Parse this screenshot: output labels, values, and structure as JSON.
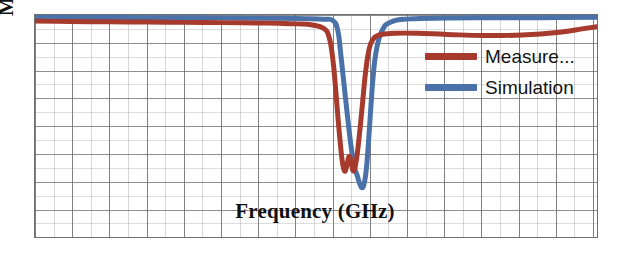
{
  "chart_data": {
    "type": "line",
    "title": "",
    "subtitle": "",
    "xlabel": "Frequency (GHz)",
    "ylabel": "Magnitude (dB)",
    "xlim": [
      0,
      15
    ],
    "ylim": [
      -8,
      0
    ],
    "grid": true,
    "grid_major_x_divisions": 15,
    "grid_major_y_divisions": 8,
    "grid_minor_subdivisions": 2,
    "axis_tick_labels_visible": false,
    "xticklabels": [],
    "yticklabels": [],
    "legend_position": "upper right",
    "annotations": [],
    "series": [
      {
        "name": "Measure...",
        "full_name": "Measure...",
        "color": "#A63A2D",
        "linewidth": 5,
        "x": [
          0.0,
          0.6,
          1.5,
          2.5,
          3.5,
          4.5,
          5.5,
          6.5,
          7.0,
          7.4,
          7.7,
          7.85,
          7.95,
          8.02,
          8.08,
          8.14,
          8.2,
          8.26,
          8.32,
          8.38,
          8.44,
          8.5,
          8.58,
          8.66,
          8.74,
          8.82,
          8.9,
          9.0,
          9.2,
          9.6,
          10.2,
          11.0,
          12.0,
          13.0,
          14.0,
          14.6,
          15.0
        ],
        "y": [
          -0.22,
          -0.23,
          -0.24,
          -0.25,
          -0.26,
          -0.27,
          -0.28,
          -0.3,
          -0.32,
          -0.36,
          -0.48,
          -0.8,
          -1.6,
          -2.6,
          -3.6,
          -4.5,
          -5.25,
          -5.62,
          -5.45,
          -5.1,
          -5.3,
          -5.62,
          -5.2,
          -4.3,
          -3.2,
          -2.1,
          -1.35,
          -0.92,
          -0.72,
          -0.66,
          -0.66,
          -0.7,
          -0.74,
          -0.72,
          -0.62,
          -0.5,
          -0.42
        ]
      },
      {
        "name": "Simulation",
        "full_name": "Simulation",
        "color": "#4A72A8",
        "linewidth": 5,
        "x": [
          0.0,
          0.6,
          1.5,
          2.5,
          3.5,
          4.5,
          5.5,
          6.5,
          7.2,
          7.7,
          7.95,
          8.08,
          8.16,
          8.24,
          8.32,
          8.4,
          8.48,
          8.54,
          8.6,
          8.66,
          8.72,
          8.78,
          8.84,
          8.9,
          8.96,
          9.02,
          9.1,
          9.25,
          9.5,
          10.0,
          11.0,
          12.0,
          13.0,
          14.0,
          15.0
        ],
        "y": [
          -0.08,
          -0.08,
          -0.09,
          -0.09,
          -0.1,
          -0.1,
          -0.11,
          -0.12,
          -0.13,
          -0.15,
          -0.2,
          -0.55,
          -1.4,
          -2.4,
          -3.4,
          -4.35,
          -5.15,
          -5.55,
          -5.78,
          -6.05,
          -6.22,
          -6.1,
          -5.6,
          -4.6,
          -3.4,
          -2.3,
          -1.35,
          -0.6,
          -0.25,
          -0.14,
          -0.11,
          -0.1,
          -0.1,
          -0.09,
          -0.08
        ]
      }
    ],
    "legend": [
      {
        "label": "Measure...",
        "color": "#A63A2D"
      },
      {
        "label": "Simulation",
        "color": "#4A72A8"
      }
    ],
    "colors": {
      "measured": "#A63A2D",
      "simulation": "#4A72A8",
      "frame": "#6F6F6F",
      "grid_major": "#5F5F64",
      "grid_minor": "#96969B",
      "background": "#FFFFFF",
      "text": "#111111"
    }
  }
}
